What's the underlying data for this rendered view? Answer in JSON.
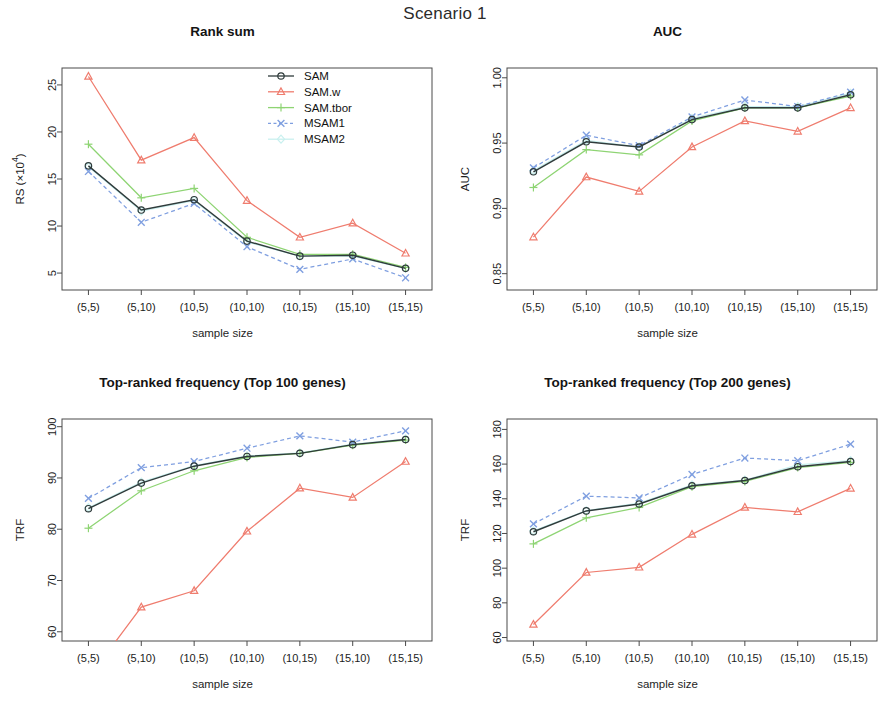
{
  "figure": {
    "main_title": "Scenario 1",
    "x_axis_title": "sample size",
    "categories": [
      "(5,5)",
      "(5,10)",
      "(10,5)",
      "(10,10)",
      "(10,15)",
      "(15,10)",
      "(15,15)"
    ]
  },
  "legend": {
    "position": "top-right of Rank sum panel",
    "entries": [
      {
        "label": "SAM",
        "color": "#2f3b3b",
        "marker": "circle",
        "dash": "solid"
      },
      {
        "label": "SAM.w",
        "color": "#ef7c6e",
        "marker": "triangle",
        "dash": "solid"
      },
      {
        "label": "SAM.tbor",
        "color": "#8ed473",
        "marker": "plus",
        "dash": "solid"
      },
      {
        "label": "MSAM1",
        "color": "#7f9fe0",
        "marker": "cross",
        "dash": "dashed"
      },
      {
        "label": "MSAM2",
        "color": "#c9f0ef",
        "marker": "diamond",
        "dash": "solid"
      }
    ]
  },
  "chart_data": [
    {
      "panel": "top-left",
      "type": "line",
      "title": "Rank sum",
      "xlabel": "sample size",
      "ylabel": "RS (×10⁴)",
      "categories": [
        "(5,5)",
        "(5,10)",
        "(10,5)",
        "(10,10)",
        "(10,15)",
        "(15,10)",
        "(15,15)"
      ],
      "ylim": [
        3.2,
        26.8
      ],
      "yticks": [
        5,
        10,
        15,
        20,
        25
      ],
      "ytick_labels": [
        "5",
        "10",
        "15",
        "20",
        "25"
      ],
      "grid": false,
      "series": [
        {
          "name": "SAM",
          "values": [
            16.4,
            11.7,
            12.8,
            8.4,
            6.8,
            6.9,
            5.5
          ]
        },
        {
          "name": "SAM.w",
          "values": [
            25.9,
            17.0,
            19.4,
            12.7,
            8.8,
            10.3,
            7.1
          ]
        },
        {
          "name": "SAM.tbor",
          "values": [
            18.7,
            13.0,
            14.0,
            8.8,
            7.0,
            7.0,
            5.6
          ]
        },
        {
          "name": "MSAM1",
          "values": [
            15.8,
            10.4,
            12.4,
            7.8,
            5.4,
            6.5,
            4.5
          ]
        },
        {
          "name": "MSAM2",
          "values": [
            16.3,
            11.6,
            12.7,
            8.3,
            6.8,
            6.8,
            5.5
          ]
        }
      ]
    },
    {
      "panel": "top-right",
      "type": "line",
      "title": "AUC",
      "xlabel": "sample size",
      "ylabel": "AUC",
      "categories": [
        "(5,5)",
        "(5,10)",
        "(10,5)",
        "(10,10)",
        "(10,15)",
        "(15,10)",
        "(15,15)"
      ],
      "ylim": [
        0.8375,
        1.0075
      ],
      "yticks": [
        0.85,
        0.9,
        0.95,
        1.0
      ],
      "ytick_labels": [
        "0.85",
        "0.90",
        "0.95",
        "1.00"
      ],
      "grid": false,
      "series": [
        {
          "name": "SAM",
          "values": [
            0.928,
            0.951,
            0.947,
            0.968,
            0.977,
            0.977,
            0.987
          ]
        },
        {
          "name": "SAM.w",
          "values": [
            0.878,
            0.924,
            0.913,
            0.947,
            0.967,
            0.959,
            0.977
          ]
        },
        {
          "name": "SAM.tbor",
          "values": [
            0.916,
            0.945,
            0.941,
            0.967,
            0.977,
            0.977,
            0.986
          ]
        },
        {
          "name": "MSAM1",
          "values": [
            0.931,
            0.956,
            0.948,
            0.97,
            0.983,
            0.978,
            0.989
          ]
        },
        {
          "name": "MSAM2",
          "values": [
            0.929,
            0.952,
            0.947,
            0.969,
            0.978,
            0.978,
            0.988
          ]
        }
      ]
    },
    {
      "panel": "bottom-left",
      "type": "line",
      "title": "Top-ranked frequency (Top 100 genes)",
      "xlabel": "sample size",
      "ylabel": "TRF",
      "categories": [
        "(5,5)",
        "(5,10)",
        "(10,5)",
        "(10,10)",
        "(10,15)",
        "(15,10)",
        "(15,15)"
      ],
      "ylim": [
        58.2,
        101.5
      ],
      "yticks": [
        60,
        70,
        80,
        90,
        100
      ],
      "ytick_labels": [
        "60",
        "70",
        "80",
        "90",
        "100"
      ],
      "grid": false,
      "series": [
        {
          "name": "SAM",
          "values": [
            84.0,
            89.0,
            92.3,
            94.2,
            94.8,
            96.5,
            97.5
          ]
        },
        {
          "name": "SAM.w",
          "values": [
            51.0,
            64.8,
            68.0,
            79.6,
            88.0,
            86.2,
            93.2
          ]
        },
        {
          "name": "SAM.tbor",
          "values": [
            80.2,
            87.5,
            91.4,
            94.0,
            94.8,
            96.4,
            97.4
          ]
        },
        {
          "name": "MSAM1",
          "values": [
            86.0,
            92.0,
            93.2,
            95.8,
            98.2,
            97.0,
            99.2
          ]
        },
        {
          "name": "MSAM2",
          "values": [
            84.2,
            89.2,
            92.4,
            94.3,
            94.9,
            96.6,
            97.6
          ]
        }
      ]
    },
    {
      "panel": "bottom-right",
      "type": "line",
      "title": "Top-ranked frequency (Top 200 genes)",
      "xlabel": "sample size",
      "ylabel": "TRF",
      "categories": [
        "(5,5)",
        "(5,10)",
        "(10,5)",
        "(10,10)",
        "(10,15)",
        "(15,10)",
        "(15,15)"
      ],
      "ylim": [
        58.0,
        186.0
      ],
      "yticks": [
        60,
        80,
        100,
        120,
        140,
        160,
        180
      ],
      "ytick_labels": [
        "60",
        "80",
        "100",
        "120",
        "140",
        "160",
        "180"
      ],
      "grid": false,
      "series": [
        {
          "name": "SAM",
          "values": [
            121.0,
            133.0,
            137.0,
            147.5,
            150.5,
            158.5,
            161.5
          ]
        },
        {
          "name": "SAM.w",
          "values": [
            67.5,
            97.5,
            100.5,
            119.5,
            135.0,
            132.5,
            146.0
          ]
        },
        {
          "name": "SAM.tbor",
          "values": [
            114.0,
            129.0,
            135.0,
            147.0,
            150.0,
            158.0,
            161.0
          ]
        },
        {
          "name": "MSAM1",
          "values": [
            125.5,
            141.5,
            140.5,
            154.0,
            163.5,
            162.0,
            171.5
          ]
        },
        {
          "name": "MSAM2",
          "values": [
            121.5,
            133.2,
            137.5,
            148.0,
            150.8,
            159.5,
            162.0
          ]
        }
      ]
    }
  ]
}
